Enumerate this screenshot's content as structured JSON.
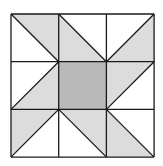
{
  "diagram": {
    "type": "quilt-block",
    "grid": {
      "rows": 3,
      "cols": 3,
      "left": 11,
      "top": 14,
      "cell": 47.7
    },
    "colors": {
      "light": "#dcdcdc",
      "dark": "#b9b9b9",
      "line": "#1a1a1a",
      "background": "#ffffff"
    },
    "cells": [
      {
        "row": 0,
        "col": 0,
        "diagonal": "tl-br",
        "shaded": "upper-right"
      },
      {
        "row": 0,
        "col": 1,
        "diagonal": "tl-br",
        "shaded": "lower-left"
      },
      {
        "row": 0,
        "col": 2,
        "diagonal": "tr-bl",
        "shaded": "lower-right"
      },
      {
        "row": 1,
        "col": 0,
        "diagonal": "tr-bl",
        "shaded": "lower-right"
      },
      {
        "row": 1,
        "col": 1,
        "diagonal": "none",
        "shaded": "full"
      },
      {
        "row": 1,
        "col": 2,
        "diagonal": "tr-bl",
        "shaded": "upper-left"
      },
      {
        "row": 2,
        "col": 0,
        "diagonal": "tr-bl",
        "shaded": "upper-left"
      },
      {
        "row": 2,
        "col": 1,
        "diagonal": "tl-br",
        "shaded": "upper-right"
      },
      {
        "row": 2,
        "col": 2,
        "diagonal": "tl-br",
        "shaded": "lower-left"
      }
    ]
  }
}
